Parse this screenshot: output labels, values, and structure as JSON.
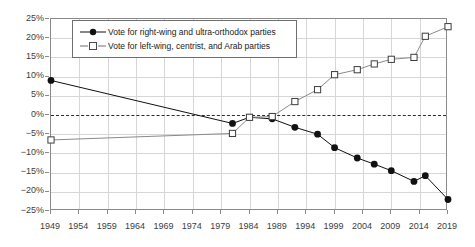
{
  "chart_data": {
    "type": "line",
    "title": "",
    "xlabel": "",
    "ylabel": "",
    "xlim": [
      1949,
      2019
    ],
    "ylim": [
      -25,
      25
    ],
    "ytick_labels": [
      "25%",
      "20%",
      "15%",
      "10%",
      "5%",
      "0%",
      "−5%",
      "−10%",
      "−15%",
      "−20%",
      "−25%"
    ],
    "ytick_values": [
      25,
      20,
      15,
      10,
      5,
      0,
      -5,
      -10,
      -15,
      -20,
      -25
    ],
    "xtick_labels": [
      "1949",
      "1954",
      "1959",
      "1964",
      "1969",
      "1974",
      "1979",
      "1984",
      "1989",
      "1994",
      "1999",
      "2004",
      "2009",
      "2014",
      "2019"
    ],
    "xtick_values": [
      1949,
      1954,
      1959,
      1964,
      1969,
      1974,
      1979,
      1984,
      1989,
      1994,
      1999,
      2004,
      2009,
      2014,
      2019
    ],
    "grid": true,
    "zero_reference_line": 0,
    "legend_position": "top-center",
    "series": [
      {
        "name": "Vote for right-wing and ultra-orthodox parties",
        "marker": "filled-circle",
        "color": "#111111",
        "x": [
          1949,
          1981,
          1984,
          1988,
          1992,
          1996,
          1999,
          2003,
          2006,
          2009,
          2013,
          2015,
          2019
        ],
        "values": [
          9.0,
          -2.2,
          -0.6,
          -1.0,
          -3.2,
          -5.0,
          -8.5,
          -11.2,
          -12.8,
          -14.5,
          -17.3,
          -15.8,
          -22.0
        ]
      },
      {
        "name": "Vote for left-wing, centrist, and Arab parties",
        "marker": "open-square",
        "color": "#8a8a8a",
        "x": [
          1949,
          1981,
          1984,
          1988,
          1992,
          1996,
          1999,
          2003,
          2006,
          2009,
          2013,
          2015,
          2019
        ],
        "values": [
          -6.5,
          -4.8,
          -0.6,
          -0.4,
          3.5,
          6.6,
          10.5,
          11.8,
          13.3,
          14.5,
          15.0,
          20.5,
          23.0
        ]
      }
    ]
  },
  "legend": {
    "items": [
      {
        "label": "Vote for right-wing and ultra-orthodox parties",
        "marker": "filled-circle"
      },
      {
        "label": "Vote for left-wing, centrist, and Arab parties",
        "marker": "open-square"
      }
    ]
  }
}
